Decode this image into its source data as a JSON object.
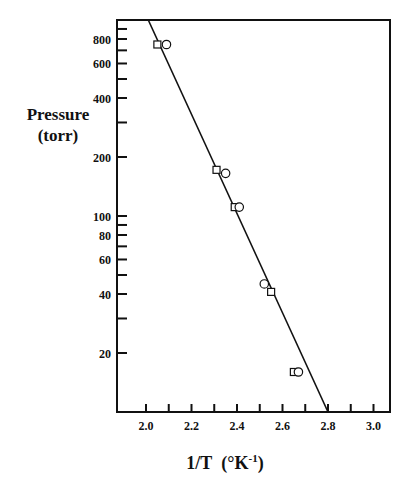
{
  "chart_data": {
    "type": "scatter",
    "title": "",
    "xlabel": "1/T (°K^-1)",
    "xlabel_main": "1/T",
    "xlabel_unit_prefix": "(°K",
    "xlabel_unit_sup": "-1",
    "xlabel_unit_suffix": ")",
    "ylabel_line1": "Pressure",
    "ylabel_line2": "(torr)",
    "ylabel": "Pressure (torr)",
    "xlim": [
      1.88,
      3.08
    ],
    "ylim": [
      10,
      1000
    ],
    "yscale": "log",
    "grid": false,
    "legend": "none",
    "x_ticks_major": [
      2.0,
      2.2,
      2.4,
      2.6,
      2.8,
      3.0
    ],
    "x_tick_labels": [
      "2.0",
      "2.2",
      "2.4",
      "2.6",
      "2.8",
      "3.0"
    ],
    "x_ticks_minor": [
      2.1,
      2.3,
      2.5,
      2.7,
      2.9
    ],
    "y_ticks_labeled": [
      20,
      40,
      60,
      80,
      100,
      200,
      400,
      600,
      800
    ],
    "y_tick_labels": [
      "20",
      "40",
      "60",
      "80",
      "100",
      "200",
      "400",
      "600",
      "800"
    ],
    "y_ticks_minor": [
      30,
      50,
      70,
      90,
      300,
      500,
      700,
      900
    ],
    "series": [
      {
        "name": "squares",
        "marker": "square",
        "x": [
          2.05,
          2.31,
          2.39,
          2.55,
          2.65
        ],
        "y": [
          750,
          172,
          111,
          41,
          16
        ]
      },
      {
        "name": "circles",
        "marker": "circle",
        "x": [
          2.09,
          2.35,
          2.41,
          2.52,
          2.67
        ],
        "y": [
          750,
          165,
          111,
          45,
          16
        ]
      },
      {
        "name": "fit line",
        "marker": "line",
        "x": [
          2.01,
          2.8
        ],
        "y": [
          1000,
          10
        ]
      }
    ]
  }
}
